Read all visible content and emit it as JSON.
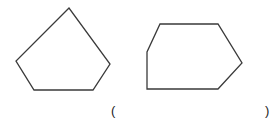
{
  "figure": {
    "shapes": [
      {
        "name": "pentagon",
        "sides": 5
      },
      {
        "name": "hexagon",
        "sides": 6
      }
    ],
    "answer_blank": {
      "open": "(",
      "close": ")",
      "value": ""
    },
    "colors": {
      "stroke": "#3a3a3a",
      "background": "#ffffff"
    }
  }
}
